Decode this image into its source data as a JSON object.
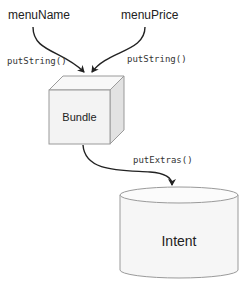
{
  "diagram": {
    "sources": [
      {
        "label": "menuName"
      },
      {
        "label": "menuPrice"
      }
    ],
    "edges": [
      {
        "label": "putString()"
      },
      {
        "label": "putString()"
      },
      {
        "label": "putExtras()"
      }
    ],
    "bundle": {
      "label": "Bundle"
    },
    "intent": {
      "label": "Intent"
    },
    "colors": {
      "stroke": "#222222",
      "shape_outline": "#9a9a9a",
      "face_front": "#f3f3f3",
      "face_top": "#f8f8f8",
      "face_side": "#e2e2e2",
      "cylinder_fill": "#f6f6f6"
    }
  }
}
